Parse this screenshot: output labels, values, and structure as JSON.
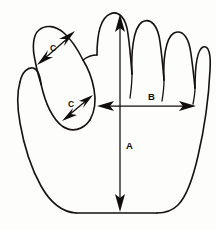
{
  "diagram": {
    "background_color": "#fdfdfc",
    "line_color": "#15120f",
    "measurements": [
      {
        "id": "A",
        "label": "A",
        "orientation": "vertical",
        "description": "hand length from middle finger tip to wrist",
        "label_x": 126,
        "label_y": 149,
        "start_x": 120,
        "start_y": 14,
        "end_x": 120,
        "end_y": 212,
        "arrowheads": "both"
      },
      {
        "id": "B",
        "label": "B",
        "orientation": "horizontal",
        "description": "palm width across knuckles",
        "label_x": 152,
        "label_y": 100,
        "start_x": 97,
        "start_y": 106,
        "end_x": 196,
        "end_y": 106,
        "arrowheads": "both"
      },
      {
        "id": "C1",
        "label": "C",
        "orientation": "diagonal",
        "description": "thumb width upper",
        "label_x": 53,
        "label_y": 49,
        "start_x": 74,
        "start_y": 32,
        "end_x": 38,
        "end_y": 64,
        "arrowheads": "both"
      },
      {
        "id": "C2",
        "label": "C",
        "orientation": "diagonal",
        "description": "thumb width lower",
        "label_x": 71,
        "label_y": 106,
        "start_x": 92,
        "start_y": 96,
        "end_x": 63,
        "end_y": 120,
        "arrowheads": "both"
      }
    ]
  }
}
